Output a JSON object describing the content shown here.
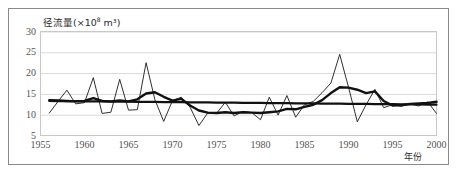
{
  "chart_data": {
    "type": "line",
    "title_main": "径流量(×10",
    "title_sup": "8",
    "title_tail": " m³)",
    "xlabel": "年份",
    "ylabel": "径流量(×10⁸ m³)",
    "xlim": [
      1955,
      2000
    ],
    "ylim": [
      5,
      30
    ],
    "grid": true,
    "legend": "none",
    "xticks": [
      "1955",
      "1960",
      "1965",
      "1970",
      "1975",
      "1980",
      "1985",
      "1990",
      "1995",
      "2000"
    ],
    "xtick_values": [
      1955,
      1960,
      1965,
      1970,
      1975,
      1980,
      1985,
      1990,
      1995,
      2000
    ],
    "yticks": [
      "5",
      "10",
      "15",
      "20",
      "25",
      "30"
    ],
    "ytick_values": [
      5,
      10,
      15,
      20,
      25,
      30
    ],
    "x": [
      1956,
      1957,
      1958,
      1959,
      1960,
      1961,
      1962,
      1963,
      1964,
      1965,
      1966,
      1967,
      1968,
      1969,
      1970,
      1971,
      1972,
      1973,
      1974,
      1975,
      1976,
      1977,
      1978,
      1979,
      1980,
      1981,
      1982,
      1983,
      1984,
      1985,
      1986,
      1987,
      1988,
      1989,
      1990,
      1991,
      1992,
      1993,
      1994,
      1995,
      1996,
      1997,
      1998,
      1999,
      2000
    ],
    "series": [
      {
        "name": "annual-runoff",
        "style": "thin-jagged",
        "color": "#1a1a1a",
        "width": 0.9,
        "values": [
          10.4,
          13.2,
          15.9,
          12.6,
          12.9,
          18.9,
          10.3,
          10.6,
          18.5,
          11.1,
          11.2,
          22.5,
          13.6,
          8.4,
          13.4,
          14.2,
          11.8,
          7.4,
          10.4,
          10.3,
          13.0,
          9.7,
          10.8,
          10.5,
          8.8,
          14.2,
          9.9,
          14.6,
          9.4,
          12.4,
          13.2,
          15.3,
          17.6,
          24.5,
          16.6,
          8.3,
          12.4,
          16.1,
          11.7,
          12.4,
          12.0,
          12.6,
          12.1,
          13.1,
          10.3
        ]
      },
      {
        "name": "moving-average",
        "style": "thick-smoothed",
        "color": "#111111",
        "width": 2.4,
        "values": [
          13.5,
          13.4,
          13.3,
          13.2,
          13.3,
          14.0,
          13.3,
          13.2,
          13.4,
          13.2,
          13.7,
          15.1,
          15.4,
          14.3,
          13.4,
          13.8,
          12.2,
          11.0,
          10.5,
          10.4,
          10.6,
          10.4,
          10.6,
          10.5,
          10.4,
          10.6,
          10.8,
          11.4,
          11.3,
          11.9,
          12.4,
          13.5,
          15.2,
          16.6,
          16.5,
          16.0,
          15.2,
          15.6,
          13.3,
          12.2,
          12.3,
          12.6,
          12.7,
          12.8,
          13.1
        ]
      },
      {
        "name": "linear-trend",
        "style": "straight-trend",
        "color": "#111111",
        "width": 2.2,
        "values": [
          13.3,
          13.28,
          13.26,
          13.24,
          13.22,
          13.2,
          13.18,
          13.16,
          13.14,
          13.12,
          13.1,
          13.08,
          13.06,
          13.04,
          13.02,
          13.0,
          12.98,
          12.96,
          12.94,
          12.92,
          12.9,
          12.88,
          12.86,
          12.84,
          12.82,
          12.8,
          12.78,
          12.76,
          12.74,
          12.72,
          12.7,
          12.68,
          12.66,
          12.64,
          12.62,
          12.6,
          12.58,
          12.56,
          12.54,
          12.52,
          12.5,
          12.48,
          12.46,
          12.44,
          12.42
        ]
      }
    ]
  },
  "colors": {
    "frame": "#8a8a8a",
    "gridline": "#d9d9d9",
    "plot_border": "#c8c8c8",
    "tick_text": "#555555",
    "label_text": "#2b2b2b",
    "background": "#ffffff"
  }
}
